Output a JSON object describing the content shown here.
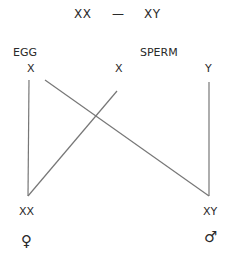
{
  "title": {
    "left": "XX",
    "dash": "—",
    "right": "XY"
  },
  "gametes": {
    "egg_label": "EGG",
    "sperm_label": "SPERM",
    "egg_x": "X",
    "sperm_x": "X",
    "sperm_y": "Y"
  },
  "offspring": {
    "female_genotype": "XX",
    "male_genotype": "XY",
    "female_symbol": "♀",
    "male_symbol": "♂"
  },
  "colors": {
    "text": "#2a2a2a",
    "line": "#777777"
  }
}
